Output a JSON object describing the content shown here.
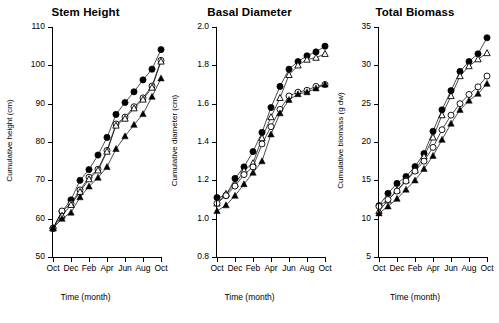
{
  "figure": {
    "background": "#ffffff",
    "ink_color": "#000000",
    "panel_count": 3
  },
  "chart_data": [
    {
      "type": "line",
      "title": "Stem Height",
      "xlabel": "Time (month)",
      "ylabel": "Cumulative height (cm)",
      "grid": false,
      "legend_position": "none",
      "x": [
        "Oct",
        "Nov",
        "Dec",
        "Jan",
        "Feb",
        "Mar",
        "Apr",
        "May",
        "Jun",
        "Jul",
        "Aug",
        "Sep",
        "Oct"
      ],
      "xticklabels": [
        "Oct",
        "Dec",
        "Feb",
        "Apr",
        "Jun",
        "Aug",
        "Oct"
      ],
      "xtick_indices": [
        0,
        2,
        4,
        6,
        8,
        10,
        12
      ],
      "xlim": [
        0,
        12
      ],
      "ylim": [
        50,
        110
      ],
      "yticks": [
        50,
        60,
        70,
        80,
        90,
        100,
        110
      ],
      "yticklabels": [
        "50",
        "60",
        "70",
        "80",
        "90",
        "100",
        "110"
      ],
      "series": [
        {
          "name": "filled-circle",
          "marker": "filled-circle",
          "values": [
            57.5,
            61.9,
            64.9,
            70.0,
            72.8,
            76.6,
            81.2,
            87.2,
            90.3,
            93.1,
            96.2,
            99.0,
            104.1
          ]
        },
        {
          "name": "open-circle",
          "marker": "open-circle",
          "values": [
            57.5,
            62.0,
            63.9,
            67.5,
            70.8,
            72.9,
            77.8,
            84.7,
            86.5,
            89.2,
            91.5,
            94.6,
            101.3
          ]
        },
        {
          "name": "open-triangle",
          "marker": "open-triangle",
          "values": [
            57.5,
            60.8,
            63.6,
            67.0,
            70.3,
            72.6,
            77.5,
            84.3,
            86.1,
            88.8,
            91.1,
            94.2,
            101.0
          ]
        },
        {
          "name": "filled-triangle",
          "marker": "filled-triangle",
          "values": [
            57.5,
            60.0,
            61.6,
            65.6,
            68.4,
            70.7,
            73.5,
            78.2,
            81.5,
            84.5,
            87.3,
            91.8,
            96.6
          ]
        }
      ]
    },
    {
      "type": "line",
      "title": "Basal Diameter",
      "xlabel": "Time (month)",
      "ylabel": "Cumulative diameter (cm)",
      "grid": false,
      "legend_position": "none",
      "x": [
        "Oct",
        "Nov",
        "Dec",
        "Jan",
        "Feb",
        "Mar",
        "Apr",
        "May",
        "Jun",
        "Jul",
        "Aug",
        "Sep",
        "Oct"
      ],
      "xticklabels": [
        "Oct",
        "Dec",
        "Feb",
        "Apr",
        "Jun",
        "Aug",
        "Oct"
      ],
      "xtick_indices": [
        0,
        2,
        4,
        6,
        8,
        10,
        12
      ],
      "xlim": [
        0,
        12
      ],
      "ylim": [
        0.8,
        2.0
      ],
      "yticks": [
        0.8,
        1.0,
        1.2,
        1.4,
        1.6,
        1.8,
        2.0
      ],
      "yticklabels": [
        "0.8",
        "1.0",
        "1.2",
        "1.4",
        "1.6",
        "1.8",
        "2.0"
      ],
      "series": [
        {
          "name": "filled-circle",
          "marker": "filled-circle",
          "values": [
            1.11,
            1.12,
            1.21,
            1.27,
            1.35,
            1.45,
            1.58,
            1.69,
            1.78,
            1.82,
            1.85,
            1.87,
            1.9
          ]
        },
        {
          "name": "open-triangle",
          "marker": "open-triangle",
          "values": [
            1.08,
            1.13,
            1.18,
            1.25,
            1.29,
            1.42,
            1.53,
            1.63,
            1.75,
            1.8,
            1.83,
            1.84,
            1.86
          ]
        },
        {
          "name": "open-circle",
          "marker": "open-circle",
          "values": [
            1.08,
            1.12,
            1.17,
            1.23,
            1.27,
            1.39,
            1.48,
            1.57,
            1.64,
            1.66,
            1.67,
            1.69,
            1.7
          ]
        },
        {
          "name": "filled-triangle",
          "marker": "filled-triangle",
          "values": [
            1.04,
            1.07,
            1.12,
            1.18,
            1.24,
            1.3,
            1.44,
            1.55,
            1.62,
            1.65,
            1.66,
            1.68,
            1.7
          ]
        }
      ]
    },
    {
      "type": "line",
      "title": "Total Biomass",
      "xlabel": "Time (month)",
      "ylabel": "Cumulative biomass (g dw)",
      "grid": false,
      "legend_position": "none",
      "x": [
        "Oct",
        "Nov",
        "Dec",
        "Jan",
        "Feb",
        "Mar",
        "Apr",
        "May",
        "Jun",
        "Jul",
        "Aug",
        "Sep",
        "Oct"
      ],
      "xticklabels": [
        "Oct",
        "Dec",
        "Feb",
        "Apr",
        "Jun",
        "Aug",
        "Oct"
      ],
      "xtick_indices": [
        0,
        2,
        4,
        6,
        8,
        10,
        12
      ],
      "xlim": [
        0,
        12
      ],
      "ylim": [
        5,
        35
      ],
      "yticks": [
        5,
        10,
        15,
        20,
        25,
        30,
        35
      ],
      "yticklabels": [
        "5",
        "10",
        "15",
        "20",
        "25",
        "30",
        "35"
      ],
      "series": [
        {
          "name": "filled-circle",
          "marker": "filled-circle",
          "values": [
            11.7,
            13.3,
            14.6,
            15.5,
            16.8,
            18.5,
            21.4,
            24.2,
            26.7,
            29.2,
            30.5,
            31.5,
            33.6
          ]
        },
        {
          "name": "open-triangle",
          "marker": "open-triangle",
          "values": [
            11.0,
            12.4,
            13.7,
            15.0,
            16.3,
            18.1,
            20.6,
            23.5,
            26.0,
            28.6,
            29.9,
            30.8,
            31.6
          ]
        },
        {
          "name": "open-circle",
          "marker": "open-circle",
          "values": [
            11.6,
            12.5,
            13.6,
            14.9,
            16.2,
            17.5,
            19.3,
            21.6,
            23.5,
            25.0,
            26.2,
            27.2,
            28.6
          ]
        },
        {
          "name": "filled-triangle",
          "marker": "filled-triangle",
          "values": [
            10.7,
            11.6,
            12.6,
            13.8,
            15.0,
            16.5,
            18.2,
            20.3,
            22.4,
            24.2,
            25.4,
            26.3,
            27.6
          ]
        }
      ]
    }
  ]
}
